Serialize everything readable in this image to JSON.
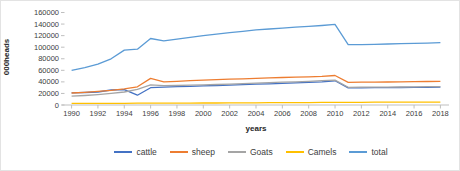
{
  "chart_data": {
    "type": "line",
    "title": "",
    "ylabel": "000heads",
    "xlabel": "years",
    "ylim": [
      0,
      160000
    ],
    "ytick_step": 20000,
    "ytick_labels": [
      "0",
      "20000",
      "40000",
      "60000",
      "80000",
      "100000",
      "120000",
      "140000",
      "160000"
    ],
    "x": [
      1990,
      1991,
      1992,
      1993,
      1994,
      1995,
      1996,
      1997,
      1998,
      1999,
      2000,
      2001,
      2002,
      2003,
      2004,
      2005,
      2006,
      2007,
      2008,
      2009,
      2010,
      2011,
      2012,
      2013,
      2014,
      2015,
      2016,
      2017,
      2018
    ],
    "xtick_labels": [
      "1990",
      "1992",
      "1994",
      "1996",
      "1998",
      "2000",
      "2002",
      "2004",
      "2006",
      "2008",
      "2010",
      "2012",
      "2014",
      "2016",
      "2018"
    ],
    "grid": false,
    "legend_position": "bottom",
    "axis_color": "#bfbfbf",
    "series": [
      {
        "name": "cattle",
        "color": "#4472C4",
        "values": [
          21000,
          21600,
          22500,
          26000,
          26500,
          17000,
          30000,
          31000,
          31700,
          32400,
          33100,
          33800,
          34500,
          35200,
          36000,
          36700,
          37500,
          38300,
          39100,
          40000,
          41800,
          29600,
          29700,
          29900,
          30100,
          30300,
          30500,
          30700,
          31000
        ]
      },
      {
        "name": "sheep",
        "color": "#ED7D31",
        "values": [
          20700,
          22000,
          23500,
          25500,
          28000,
          31500,
          46000,
          40000,
          41000,
          42000,
          43000,
          43800,
          44600,
          45400,
          46200,
          47000,
          47600,
          48200,
          48800,
          49500,
          51000,
          39300,
          39400,
          39600,
          39800,
          40000,
          40300,
          40600,
          41000
        ]
      },
      {
        "name": "Goats",
        "color": "#A5A5A5",
        "values": [
          15300,
          16500,
          18000,
          20000,
          22500,
          27000,
          35000,
          33500,
          33800,
          34200,
          34800,
          35500,
          36200,
          37000,
          37800,
          38600,
          39400,
          40200,
          41000,
          42000,
          43100,
          30600,
          30800,
          30900,
          31000,
          31200,
          31400,
          31600,
          31800
        ]
      },
      {
        "name": "Camels",
        "color": "#FFC000",
        "values": [
          2800,
          2900,
          2900,
          3000,
          3000,
          3100,
          3100,
          3200,
          3300,
          3300,
          3400,
          3500,
          3600,
          3700,
          3800,
          3900,
          4000,
          4100,
          4200,
          4500,
          4600,
          4700,
          4750,
          4800,
          4800,
          4800,
          4850,
          4850,
          4850
        ]
      },
      {
        "name": "total",
        "color": "#5B9BD5",
        "values": [
          60000,
          64500,
          70500,
          80000,
          95000,
          96500,
          115000,
          111000,
          114000,
          117000,
          120000,
          122500,
          125000,
          127500,
          130000,
          131500,
          133000,
          134500,
          136000,
          137500,
          139500,
          104500,
          104500,
          105000,
          105500,
          106000,
          106500,
          107000,
          108000
        ]
      }
    ]
  }
}
